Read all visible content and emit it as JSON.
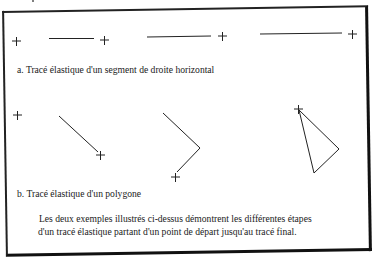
{
  "figure": {
    "section_a": {
      "caption": "a. Tracé élastique d'un segment de droite horizontal",
      "steps": [
        {
          "marker": "+"
        },
        {
          "line": "horizontal-short",
          "marker": "+"
        },
        {
          "line": "horizontal-medium",
          "marker": "+"
        },
        {
          "line": "horizontal-long",
          "marker": "+"
        }
      ]
    },
    "section_b": {
      "caption": "b. Tracé élastique d'un polygone",
      "steps": [
        {
          "marker": "+"
        },
        {
          "shape": "single-segment",
          "marker": "+"
        },
        {
          "shape": "two-segments",
          "marker": "+"
        },
        {
          "shape": "closed-triangle",
          "marker": "+"
        }
      ]
    },
    "description": {
      "line1": "Les deux exemples illustrés ci-dessus démontrent les différentes étapes",
      "line2": "d'un tracé élastique partant d'un point de départ jusqu'au tracé final."
    },
    "colors": {
      "ink": "#1a1a1a",
      "paper": "#ffffff"
    }
  }
}
